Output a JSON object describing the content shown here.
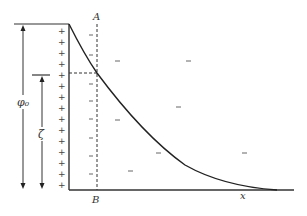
{
  "diagram": {
    "labels": {
      "A": "A",
      "B": "B",
      "phi0": "φ₀",
      "zeta": "ζ",
      "x": "x"
    },
    "surface_charge_sign": "+",
    "diffuse_charge_sign": "–",
    "plus_count": 15,
    "minus_signs_near_plane": 8,
    "minus_signs_diffuse": [
      {
        "x": 118,
        "y": 61
      },
      {
        "x": 189,
        "y": 61
      },
      {
        "x": 179,
        "y": 107
      },
      {
        "x": 118,
        "y": 120
      },
      {
        "x": 159,
        "y": 153
      },
      {
        "x": 245,
        "y": 153
      },
      {
        "x": 131,
        "y": 171
      }
    ],
    "colors": {
      "line": "#333333",
      "background": "#ffffff"
    }
  }
}
